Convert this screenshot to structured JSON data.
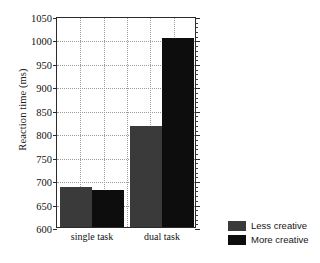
{
  "chart_data": {
    "type": "bar",
    "title": "",
    "xlabel": "",
    "ylabel": "Reaction time (ms)",
    "categories": [
      "single task",
      "dual task"
    ],
    "series": [
      {
        "name": "Less creative",
        "color": "#3a3a3a",
        "values": [
          685,
          815
        ]
      },
      {
        "name": "More creative",
        "color": "#0d0d0d",
        "values": [
          679,
          1003
        ]
      }
    ],
    "ylim": [
      600,
      1050
    ],
    "ytick_step": 50,
    "yticks": [
      600,
      650,
      700,
      750,
      800,
      850,
      900,
      950,
      1000,
      1050
    ],
    "ytick_labels": [
      "600",
      "650",
      "700",
      "750",
      "800",
      "850",
      "900",
      "950",
      "1000",
      "1050"
    ],
    "grid": true,
    "grid_style": "dotted",
    "legend_position": "bottom-right-outside",
    "minor_ticks_right_axis": true
  },
  "legend": {
    "entries": [
      {
        "label": "Less creative",
        "color": "#3a3a3a"
      },
      {
        "label": "More creative",
        "color": "#0d0d0d"
      }
    ]
  }
}
